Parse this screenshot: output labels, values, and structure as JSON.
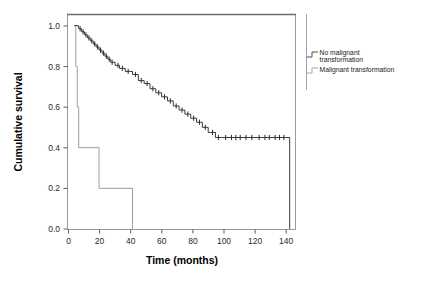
{
  "chart_data": {
    "type": "line",
    "title": "",
    "xlabel": "Time (months)",
    "ylabel": "Cumulative survival",
    "xlim": [
      -4,
      152
    ],
    "ylim": [
      0.0,
      1.05
    ],
    "xticks": [
      "0",
      "20",
      "40",
      "60",
      "80",
      "100",
      "120",
      "140"
    ],
    "xtick_values": [
      0,
      20,
      40,
      60,
      80,
      100,
      120,
      140
    ],
    "yticks": [
      "0.0",
      "0.2",
      "0.4",
      "0.6",
      "0.8",
      "1.0"
    ],
    "ytick_values": [
      0.0,
      0.2,
      0.4,
      0.6,
      0.8,
      1.0
    ],
    "grid": false,
    "legend_position": "right",
    "series": [
      {
        "name": "No malignant transformation",
        "color": "#3a3a3a",
        "step_points": [
          [
            0,
            1.0
          ],
          [
            3,
            1.0
          ],
          [
            3,
            0.985
          ],
          [
            5,
            0.985
          ],
          [
            5,
            0.97
          ],
          [
            7,
            0.97
          ],
          [
            7,
            0.955
          ],
          [
            9,
            0.955
          ],
          [
            9,
            0.94
          ],
          [
            11,
            0.94
          ],
          [
            11,
            0.925
          ],
          [
            13,
            0.925
          ],
          [
            13,
            0.91
          ],
          [
            15,
            0.91
          ],
          [
            15,
            0.895
          ],
          [
            17,
            0.895
          ],
          [
            17,
            0.88
          ],
          [
            19,
            0.88
          ],
          [
            19,
            0.865
          ],
          [
            21,
            0.865
          ],
          [
            21,
            0.85
          ],
          [
            23,
            0.85
          ],
          [
            23,
            0.835
          ],
          [
            25,
            0.835
          ],
          [
            25,
            0.82
          ],
          [
            28,
            0.82
          ],
          [
            28,
            0.805
          ],
          [
            31,
            0.805
          ],
          [
            31,
            0.79
          ],
          [
            35,
            0.79
          ],
          [
            35,
            0.775
          ],
          [
            40,
            0.775
          ],
          [
            40,
            0.76
          ],
          [
            44,
            0.76
          ],
          [
            44,
            0.73
          ],
          [
            48,
            0.73
          ],
          [
            48,
            0.715
          ],
          [
            52,
            0.715
          ],
          [
            52,
            0.69
          ],
          [
            56,
            0.69
          ],
          [
            56,
            0.67
          ],
          [
            60,
            0.67
          ],
          [
            60,
            0.65
          ],
          [
            64,
            0.65
          ],
          [
            64,
            0.63
          ],
          [
            68,
            0.63
          ],
          [
            68,
            0.605
          ],
          [
            72,
            0.605
          ],
          [
            72,
            0.585
          ],
          [
            76,
            0.585
          ],
          [
            76,
            0.565
          ],
          [
            80,
            0.565
          ],
          [
            80,
            0.545
          ],
          [
            84,
            0.545
          ],
          [
            84,
            0.525
          ],
          [
            88,
            0.525
          ],
          [
            88,
            0.5
          ],
          [
            92,
            0.5
          ],
          [
            92,
            0.475
          ],
          [
            97,
            0.475
          ],
          [
            97,
            0.45
          ],
          [
            101,
            0.45
          ],
          [
            148,
            0.45
          ],
          [
            148,
            0.0
          ]
        ],
        "censor_times": [
          4,
          6,
          8,
          10,
          12,
          14,
          16,
          18,
          20,
          22,
          24,
          26,
          30,
          33,
          37,
          42,
          46,
          50,
          54,
          58,
          62,
          66,
          70,
          74,
          78,
          82,
          86,
          90,
          95,
          99,
          104,
          108,
          111,
          114,
          118,
          122,
          127,
          131,
          134,
          138,
          141,
          144
        ],
        "censor_level_note": "ticks drawn at the curve height at that time"
      },
      {
        "name": "Malignant transformation",
        "color": "#9d9d9d",
        "step_points": [
          [
            0,
            1.0
          ],
          [
            1,
            1.0
          ],
          [
            1,
            0.8
          ],
          [
            2,
            0.8
          ],
          [
            2,
            0.6
          ],
          [
            3,
            0.6
          ],
          [
            3,
            0.4
          ],
          [
            17,
            0.4
          ],
          [
            17,
            0.2
          ],
          [
            40,
            0.2
          ],
          [
            40,
            0.0
          ]
        ],
        "censor_times": []
      }
    ]
  },
  "legend": {
    "entries": [
      {
        "label_line1": "No malignant",
        "label_line2": "transformation",
        "icon": "step-line-icon"
      },
      {
        "label_line1": "Malignant transformation",
        "label_line2": "",
        "icon": "step-line-icon"
      }
    ]
  }
}
